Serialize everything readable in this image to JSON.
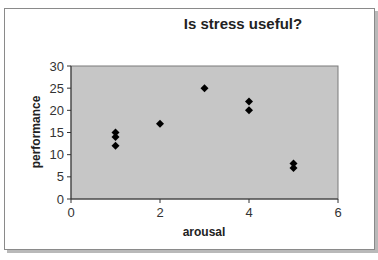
{
  "chart_data": {
    "type": "scatter",
    "title": "Is stress useful?",
    "xlabel": "arousal",
    "ylabel": "performance",
    "xlim": [
      0,
      6
    ],
    "ylim": [
      0,
      30
    ],
    "x_ticks": [
      0,
      2,
      4,
      6
    ],
    "y_ticks": [
      0,
      5,
      10,
      15,
      20,
      25,
      30
    ],
    "grid": false,
    "legend": null,
    "marker": "diamond",
    "colors": {
      "plot_background": "#c0c0c0",
      "marker": "#000000"
    },
    "series": [
      {
        "name": "performance",
        "x": [
          1,
          1,
          1,
          2,
          3,
          4,
          4,
          5,
          5
        ],
        "y": [
          15,
          14,
          12,
          17,
          25,
          22,
          20,
          8,
          7
        ]
      }
    ]
  }
}
